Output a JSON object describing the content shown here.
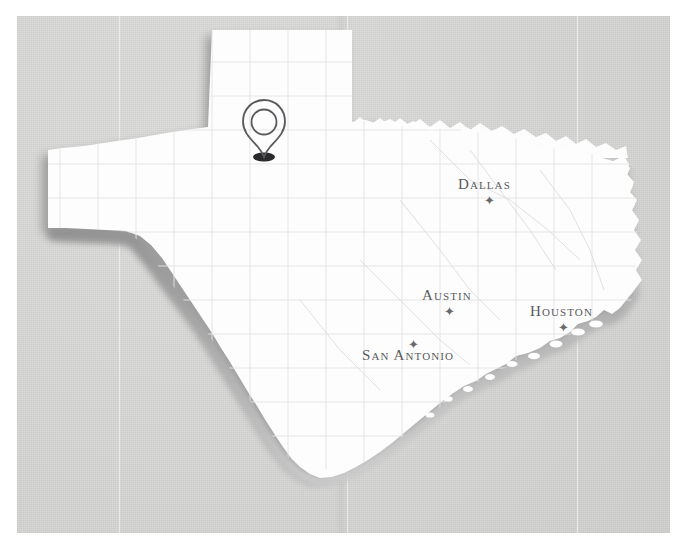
{
  "map": {
    "title": "Texas",
    "background_color": "#d9d9d8",
    "land_color": "#fdfdfd",
    "shadow_color": "#9a9a9a",
    "border_color": "#ffffff",
    "cities": [
      {
        "name": "Dallas",
        "label": "Dallas",
        "marker": "star",
        "marker_position": "below",
        "x": 488,
        "y": 186
      },
      {
        "name": "Austin",
        "label": "Austin",
        "marker": "star",
        "marker_position": "below",
        "x": 448,
        "y": 296
      },
      {
        "name": "Houston",
        "label": "Houston",
        "marker": "star",
        "marker_position": "below",
        "x": 562,
        "y": 313
      },
      {
        "name": "San Antonio",
        "label": "San Antonio",
        "marker": "star",
        "marker_position": "above",
        "x": 412,
        "y": 356
      }
    ],
    "pin": {
      "icon": "map-pin-icon",
      "x": 264,
      "y": 158,
      "color": "#55555a"
    },
    "star_glyph": "✦"
  }
}
